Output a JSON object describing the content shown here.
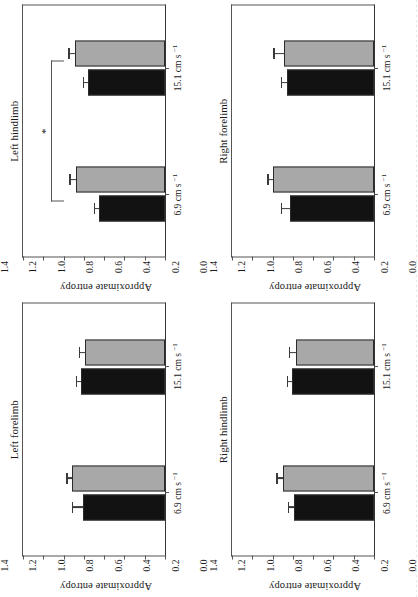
{
  "figure": {
    "rotation_degrees": -90,
    "colors": {
      "series_black": "#121212",
      "series_grey": "#a8a8a8",
      "axis": "#555555",
      "text": "#1a1a1a"
    },
    "axis": {
      "y_label": "Approximate entropy",
      "y_ticks": [
        "1.4",
        "1.2",
        "1.0",
        "0.8",
        "0.6",
        "0.4",
        "0.2",
        "0.0"
      ],
      "y_min": 0.0,
      "y_max": 1.4
    },
    "categories": [
      {
        "value": "6.9",
        "unit": "cm s",
        "exponent": "−1"
      },
      {
        "value": "15.1",
        "unit": "cm s",
        "exponent": "−1"
      }
    ],
    "significance_marker": "*"
  },
  "chart_data": [
    {
      "type": "bar",
      "title": "Left forelimb",
      "panel_position": "top-left",
      "xlabel": "",
      "ylabel": "Approximate entropy",
      "ylim": [
        0.0,
        1.4
      ],
      "grid": false,
      "legend": "none",
      "categories": [
        "6.9 cm s−1",
        "15.1 cm s−1"
      ],
      "series": [
        {
          "name": "black",
          "values": [
            0.81,
            0.83
          ],
          "errors": [
            0.1,
            0.04
          ]
        },
        {
          "name": "grey",
          "values": [
            0.92,
            0.79
          ],
          "errors": [
            0.04,
            0.05
          ]
        }
      ],
      "annotations": []
    },
    {
      "type": "bar",
      "title": "Left hindlimb",
      "panel_position": "top-right",
      "xlabel": "",
      "ylabel": "Approximate entropy",
      "ylim": [
        0.0,
        1.4
      ],
      "grid": false,
      "legend": "none",
      "categories": [
        "6.9 cm s−1",
        "15.1 cm s−1"
      ],
      "series": [
        {
          "name": "black",
          "values": [
            0.65,
            0.76
          ],
          "errors": [
            0.04,
            0.04
          ]
        },
        {
          "name": "grey",
          "values": [
            0.88,
            0.89
          ],
          "errors": [
            0.05,
            0.05
          ]
        }
      ],
      "annotations": [
        {
          "text": "*",
          "spans": [
            "6.9 cm s−1",
            "15.1 cm s−1"
          ],
          "level": 1.12
        }
      ]
    },
    {
      "type": "bar",
      "title": "Right hindlimb",
      "panel_position": "bottom-left",
      "xlabel": "",
      "ylabel": "Approximate entropy",
      "ylim": [
        0.0,
        1.4
      ],
      "grid": false,
      "legend": "none",
      "categories": [
        "6.9 cm s−1",
        "15.1 cm s−1"
      ],
      "series": [
        {
          "name": "black",
          "values": [
            0.79,
            0.81
          ],
          "errors": [
            0.05,
            0.04
          ]
        },
        {
          "name": "grey",
          "values": [
            0.9,
            0.77
          ],
          "errors": [
            0.05,
            0.06
          ]
        }
      ],
      "annotations": []
    },
    {
      "type": "bar",
      "title": "Right forelimb",
      "panel_position": "bottom-right",
      "xlabel": "",
      "ylabel": "Approximate entropy",
      "ylim": [
        0.0,
        1.4
      ],
      "grid": false,
      "legend": "none",
      "categories": [
        "6.9 cm s−1",
        "15.1 cm s−1"
      ],
      "series": [
        {
          "name": "black",
          "values": [
            0.83,
            0.86
          ],
          "errors": [
            0.08,
            0.05
          ]
        },
        {
          "name": "grey",
          "values": [
            1.0,
            0.89
          ],
          "errors": [
            0.04,
            0.09
          ]
        }
      ],
      "annotations": []
    }
  ]
}
